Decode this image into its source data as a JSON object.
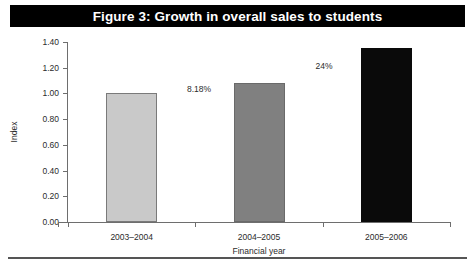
{
  "figure": {
    "title": "Figure 3: Growth in overall sales to students",
    "title_bar_color": "#000000",
    "title_text_color": "#ffffff",
    "rule_color": "#555555"
  },
  "chart_data": {
    "type": "bar",
    "title": "Figure 3: Growth in overall sales to students",
    "xlabel": "Financial year",
    "ylabel": "Index",
    "categories": [
      "2003–2004",
      "2004–2005",
      "2005–2006"
    ],
    "values": [
      1.0,
      1.08,
      1.35
    ],
    "ylim": [
      0.0,
      1.4
    ],
    "ytick_values": [
      0.0,
      0.2,
      0.4,
      0.6,
      0.8,
      1.0,
      1.2,
      1.4
    ],
    "ytick_labels": [
      "0.00",
      "0.20",
      "0.40",
      "0.60",
      "0.80",
      "1.00",
      "1.20",
      "1.40"
    ],
    "grid": false,
    "legend": "none",
    "bar_colors": [
      "#c9c9c9",
      "#808080",
      "#0a0a0a"
    ],
    "bar_border_colors": [
      "#7a7a7a",
      "#6a6a6a",
      "#0a0a0a"
    ],
    "annotations": [
      {
        "text": "8.18%",
        "near_category": "2004–2005",
        "x_px": 199,
        "y_px": 84
      },
      {
        "text": "24%",
        "near_category": "2005–2006",
        "x_px": 324,
        "y_px": 61
      }
    ]
  }
}
